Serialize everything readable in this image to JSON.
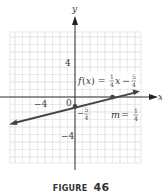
{
  "figure": {
    "caption_word": "FIGURE",
    "caption_number": "46"
  },
  "chart_data": {
    "type": "line",
    "title": "",
    "function_label": "f(x) = 1/4 x − 5/4",
    "xlabel": "x",
    "ylabel": "y",
    "xlim": [
      -8.7,
      8.7
    ],
    "ylim": [
      -8.7,
      8.7
    ],
    "grid": true,
    "grid_step": 1,
    "x_tick_labels": [
      {
        "value": -4,
        "label": "−4"
      }
    ],
    "y_tick_labels": [
      {
        "value": 4,
        "label": "4"
      },
      {
        "value": -4,
        "label": "−4"
      }
    ],
    "origin_label": "0",
    "series": [
      {
        "name": "f(x) = (1/4)x − 5/4",
        "slope": 0.25,
        "intercept": -1.25,
        "x": [
          -8.67,
          8.67
        ],
        "y": [
          -3.42,
          0.92
        ],
        "marked_points": [
          {
            "x": 0,
            "y": -1.25,
            "label": "−5/4"
          },
          {
            "x": 5,
            "y": 0
          }
        ]
      }
    ],
    "annotations": [
      {
        "text": "f(x) = 1/4 x − 5/4",
        "position": "above line, right of y-axis"
      },
      {
        "text": "m = 1/4",
        "position": "below line, right"
      },
      {
        "text": "−5/4",
        "position": "y-intercept label"
      }
    ]
  },
  "labels": {
    "x_axis": "x",
    "y_axis": "y",
    "tick_neg4_x": "−4",
    "tick_4_y": "4",
    "tick_neg4_y": "−4",
    "origin": "0",
    "func_f": "f",
    "func_x": "(x) = ",
    "func_frac1_num": "1",
    "func_frac1_den": "4",
    "func_var": "x",
    "func_minus": "−",
    "func_frac2_num": "5",
    "func_frac2_den": "4",
    "intercept_minus": "−",
    "intercept_num": "5",
    "intercept_den": "4",
    "slope_m": "m",
    "slope_eq": " = ",
    "slope_num": "1",
    "slope_den": "4"
  }
}
